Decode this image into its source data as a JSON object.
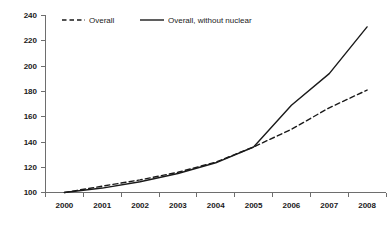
{
  "chart_data": {
    "type": "line",
    "title": "",
    "xlabel": "",
    "ylabel": "",
    "categories": [
      "2000",
      "2001",
      "2002",
      "2003",
      "2004",
      "2005",
      "2006",
      "2007",
      "2008"
    ],
    "series": [
      {
        "name": "Overall",
        "style": "dashed",
        "color": "#1a1a1a",
        "values": [
          100,
          105,
          110,
          116,
          124,
          136,
          150,
          167,
          181
        ]
      },
      {
        "name": "Overall, without nuclear",
        "style": "solid",
        "color": "#1a1a1a",
        "values": [
          100,
          103.5,
          108.5,
          115,
          123.5,
          136,
          169,
          194,
          231
        ]
      }
    ],
    "ylim": [
      100,
      240
    ],
    "ytick_values": [
      100,
      120,
      140,
      160,
      180,
      200,
      220,
      240
    ],
    "ytick_labels": [
      "100",
      "120",
      "140",
      "160",
      "180",
      "200",
      "220",
      "240"
    ],
    "grid": false,
    "legend_position": "top-inside",
    "axis_color": "#6e6e6e",
    "background": "#ffffff"
  },
  "legend": {
    "items": [
      {
        "label": "Overall",
        "style": "dashed"
      },
      {
        "label": "Overall, without nuclear",
        "style": "solid"
      }
    ]
  },
  "yticks": {
    "t0": "240",
    "t1": "220",
    "t2": "200",
    "t3": "180",
    "t4": "160",
    "t5": "140",
    "t6": "120",
    "t7": "100"
  },
  "xticks": {
    "t0": "2000",
    "t1": "2001",
    "t2": "2002",
    "t3": "2003",
    "t4": "2004",
    "t5": "2005",
    "t6": "2006",
    "t7": "2007",
    "t8": "2008"
  }
}
